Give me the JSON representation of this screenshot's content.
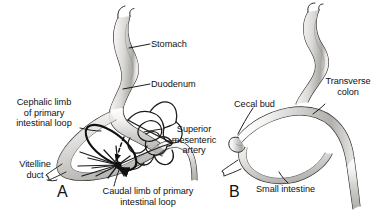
{
  "figure": {
    "kind": "anatomy-illustration",
    "background_color": "#ffffff",
    "ink_color": "#111111",
    "tube_fill_light": "#f2f1ef",
    "tube_fill_mid": "#c9c7c4",
    "tube_fill_dark": "#9b9995"
  },
  "panels": [
    {
      "id": "A",
      "letter": "A",
      "labels": [
        {
          "id": "stomach",
          "text": "Stomach",
          "lines": [
            "Stomach"
          ]
        },
        {
          "id": "duodenum",
          "text": "Duodenum",
          "lines": [
            "Duodenum"
          ]
        },
        {
          "id": "cephalic-limb",
          "text": "Cephalic limb of primary intestinal loop",
          "lines": [
            "Cephalic limb",
            "of primary",
            "intestinal loop"
          ]
        },
        {
          "id": "sma",
          "text": "Superior mesenteric artery",
          "lines": [
            "Superior",
            "mesenteric",
            "artery"
          ]
        },
        {
          "id": "vitelline-duct",
          "text": "Vitelline duct",
          "lines": [
            "Vitelline",
            "duct"
          ]
        },
        {
          "id": "caudal-limb",
          "text": "Caudal limb of primary intestinal loop",
          "lines": [
            "Caudal limb of primary",
            "intestinal loop"
          ]
        }
      ]
    },
    {
      "id": "B",
      "letter": "B",
      "labels": [
        {
          "id": "cecal-bud",
          "text": "Cecal bud",
          "lines": [
            "Cecal bud"
          ]
        },
        {
          "id": "transverse-colon",
          "text": "Transverse colon",
          "lines": [
            "Transverse",
            "colon"
          ]
        },
        {
          "id": "small-intestine",
          "text": "Small intestine",
          "lines": [
            "Small intestine"
          ]
        }
      ]
    }
  ],
  "panelA": {
    "stomach": "Stomach",
    "duodenum": "Duodenum",
    "cephalic_1": "Cephalic limb",
    "cephalic_2": "of primary",
    "cephalic_3": "intestinal loop",
    "sma_1": "Superior",
    "sma_2": "mesenteric",
    "sma_3": "artery",
    "vitelline_1": "Vitelline",
    "vitelline_2": "duct",
    "caudal_1": "Caudal limb of primary",
    "caudal_2": "intestinal loop",
    "letter": "A"
  },
  "panelB": {
    "cecal_bud": "Cecal bud",
    "transverse_1": "Transverse",
    "transverse_2": "colon",
    "small_intestine": "Small intestine",
    "letter": "B"
  }
}
